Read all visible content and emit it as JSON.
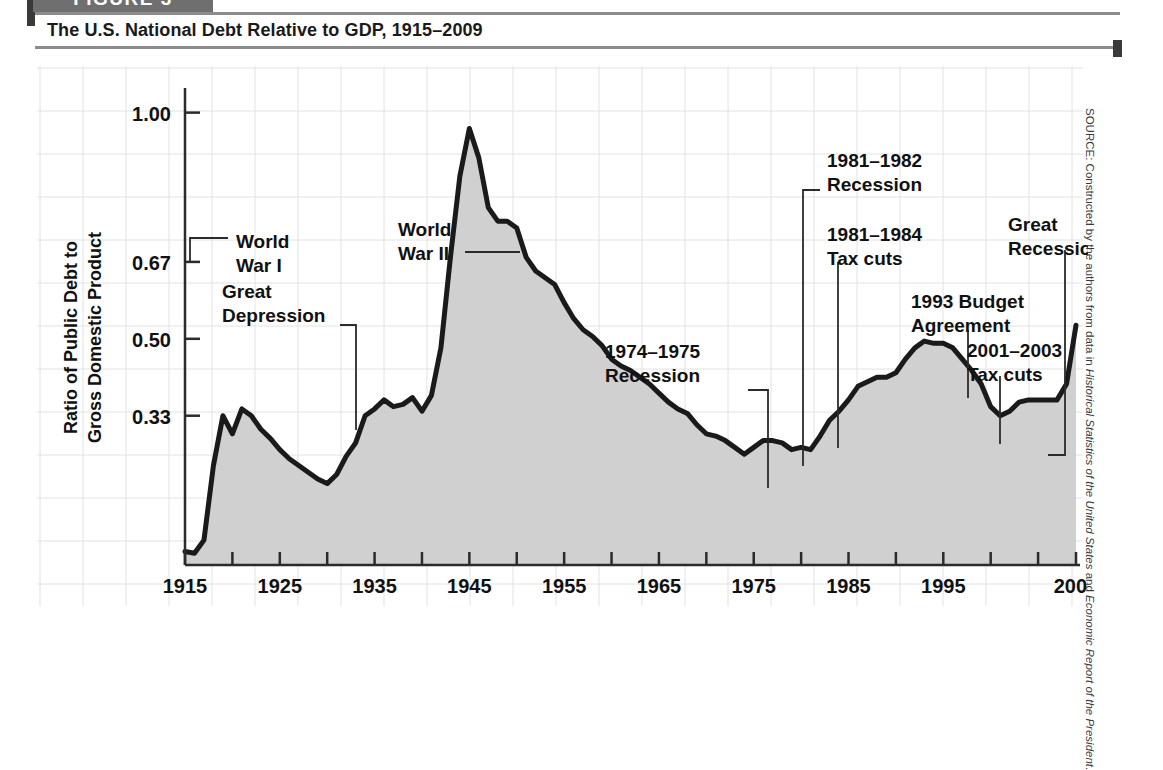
{
  "figure": {
    "tab_label": "FIGURE 3",
    "title": "The U.S. National Debt Relative to GDP, 1915–2009"
  },
  "source": {
    "prefix": "SOURCE: Constructed by the authors from data in ",
    "italic_one": "Historical Statistics of the United States",
    "middle": " and ",
    "italic_two": "Economic Report of the President",
    "suffix": "."
  },
  "chart_data": {
    "type": "area",
    "title": "The U.S. National Debt Relative to GDP, 1915–2009",
    "xlabel": "Year",
    "ylabel": "Ratio of Public Debt to Gross Domestic Product",
    "xlim": [
      1915,
      2009
    ],
    "ylim": [
      0,
      1.05
    ],
    "grid": true,
    "legend": "none",
    "y_ticks": [
      "1.00",
      "0.67",
      "0.50",
      "0.33"
    ],
    "y_tick_values": [
      1.0,
      0.67,
      0.5,
      0.33
    ],
    "x_ticks": [
      "1915",
      "1925",
      "1935",
      "1945",
      "1955",
      "1965",
      "1975",
      "1985",
      "1995",
      "2009"
    ],
    "x_tick_values": [
      1915,
      1925,
      1935,
      1945,
      1955,
      1965,
      1975,
      1985,
      1995,
      2009
    ],
    "x_minor_ticks": [
      1920,
      1930,
      1940,
      1950,
      1960,
      1970,
      1980,
      1990,
      2000,
      2005
    ],
    "colors": {
      "line": "#1a1a1a",
      "fill": "#d0d0d0",
      "grid": "#e2e2e2",
      "axis": "#2b2b2b",
      "text": "#111111"
    },
    "x": [
      1915,
      1916,
      1917,
      1918,
      1919,
      1920,
      1921,
      1922,
      1923,
      1924,
      1925,
      1926,
      1927,
      1928,
      1929,
      1930,
      1931,
      1932,
      1933,
      1934,
      1935,
      1936,
      1937,
      1938,
      1939,
      1940,
      1941,
      1942,
      1943,
      1944,
      1945,
      1946,
      1947,
      1948,
      1949,
      1950,
      1951,
      1952,
      1953,
      1954,
      1955,
      1956,
      1957,
      1958,
      1959,
      1960,
      1961,
      1962,
      1963,
      1964,
      1965,
      1966,
      1967,
      1968,
      1969,
      1970,
      1971,
      1972,
      1973,
      1974,
      1975,
      1976,
      1977,
      1978,
      1979,
      1980,
      1981,
      1982,
      1983,
      1984,
      1985,
      1986,
      1987,
      1988,
      1989,
      1990,
      1991,
      1992,
      1993,
      1994,
      1995,
      1996,
      1997,
      1998,
      1999,
      2000,
      2001,
      2002,
      2003,
      2004,
      2005,
      2006,
      2007,
      2008,
      2009
    ],
    "values": [
      0.03,
      0.026,
      0.055,
      0.22,
      0.33,
      0.29,
      0.345,
      0.33,
      0.3,
      0.28,
      0.255,
      0.235,
      0.22,
      0.205,
      0.19,
      0.18,
      0.2,
      0.24,
      0.27,
      0.33,
      0.345,
      0.365,
      0.35,
      0.355,
      0.37,
      0.34,
      0.375,
      0.48,
      0.68,
      0.86,
      0.965,
      0.9,
      0.79,
      0.76,
      0.76,
      0.745,
      0.68,
      0.65,
      0.635,
      0.62,
      0.58,
      0.545,
      0.52,
      0.505,
      0.485,
      0.455,
      0.44,
      0.43,
      0.415,
      0.4,
      0.38,
      0.36,
      0.345,
      0.335,
      0.31,
      0.29,
      0.285,
      0.275,
      0.26,
      0.245,
      0.26,
      0.275,
      0.275,
      0.27,
      0.255,
      0.26,
      0.255,
      0.285,
      0.32,
      0.34,
      0.365,
      0.395,
      0.405,
      0.415,
      0.415,
      0.425,
      0.455,
      0.48,
      0.495,
      0.49,
      0.49,
      0.48,
      0.455,
      0.43,
      0.4,
      0.35,
      0.33,
      0.34,
      0.36,
      0.365,
      0.365,
      0.365,
      0.365,
      0.4,
      0.53
    ],
    "annotations": [
      {
        "id": "world-war-i",
        "label_lines": [
          "World",
          "War I"
        ],
        "year": 1919,
        "value": 0.33
      },
      {
        "id": "great-depression",
        "label_lines": [
          "Great",
          "Depression"
        ],
        "year": 1932,
        "value": 0.24
      },
      {
        "id": "world-war-ii",
        "label_lines": [
          "World",
          "War II"
        ],
        "year": 1944,
        "value": 0.72
      },
      {
        "id": "recession-1974-1975",
        "label_lines": [
          "1974–1975",
          "Recession"
        ],
        "year": 1975,
        "value": 0.26
      },
      {
        "id": "recession-1981-1982",
        "label_lines": [
          "1981–1982",
          "Recession"
        ],
        "year": 1982,
        "value": 0.285
      },
      {
        "id": "tax-cuts-1981-1984",
        "label_lines": [
          "1981–1984",
          "Tax cuts"
        ],
        "year": 1984,
        "value": 0.34
      },
      {
        "id": "budget-agreement-1993",
        "label_lines": [
          "1993 Budget",
          "Agreement"
        ],
        "year": 1993,
        "value": 0.495
      },
      {
        "id": "tax-cuts-2001-2003",
        "label_lines": [
          "2001–2003",
          "Tax cuts"
        ],
        "year": 2001,
        "value": 0.33
      },
      {
        "id": "great-recession",
        "label_lines": [
          "Great",
          "Recession"
        ],
        "year": 2009,
        "value": 0.53
      }
    ]
  }
}
